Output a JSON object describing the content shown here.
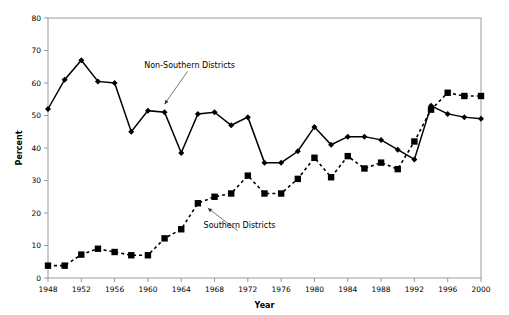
{
  "chart_data": {
    "type": "line",
    "title": "",
    "xlabel": "Year",
    "ylabel": "Percent",
    "xlim": [
      1948,
      2000
    ],
    "ylim": [
      0,
      80
    ],
    "ytick_step": 10,
    "xtick_step": 4,
    "grid": false,
    "legend_position": "inline-annotations",
    "x": [
      1948,
      1950,
      1952,
      1954,
      1956,
      1958,
      1960,
      1962,
      1964,
      1966,
      1968,
      1970,
      1972,
      1974,
      1976,
      1978,
      1980,
      1982,
      1984,
      1986,
      1988,
      1990,
      1992,
      1994,
      1996,
      1998,
      2000
    ],
    "xtick_labels": [
      "1948",
      "1952",
      "1956",
      "1960",
      "1964",
      "1968",
      "1972",
      "1976",
      "1980",
      "1984",
      "1988",
      "1992",
      "1996",
      "2000"
    ],
    "ytick_labels": [
      "0",
      "10",
      "20",
      "30",
      "40",
      "50",
      "60",
      "70",
      "80"
    ],
    "series": [
      {
        "name": "Non-Southern Districts",
        "marker": "diamond",
        "linestyle": "solid",
        "color": "#000000",
        "values": [
          52,
          61,
          67,
          60.5,
          60,
          45,
          51.5,
          51,
          38.5,
          50.5,
          51,
          47,
          49.5,
          35.5,
          35.5,
          39,
          46.5,
          41,
          43.5,
          43.5,
          42.5,
          39.5,
          36.5,
          53,
          50.5,
          49.5,
          49
        ]
      },
      {
        "name": "Southern Districts",
        "marker": "square",
        "linestyle": "dashed",
        "color": "#000000",
        "values": [
          3.8,
          3.8,
          7.2,
          9,
          8,
          7,
          7,
          12.2,
          15,
          23,
          25,
          26,
          31.5,
          26,
          26,
          30.5,
          37,
          31,
          37.5,
          33.7,
          35.5,
          33.5,
          42,
          51.8,
          57,
          56,
          56
        ]
      }
    ],
    "annotations": [
      {
        "text": "Non-Southern Districts",
        "x": 1965,
        "y": 64.5,
        "point_x": 1962,
        "point_y": 53.5
      },
      {
        "text": "Southern Districts",
        "x": 1971,
        "y": 15.5,
        "point_x": 1967.2,
        "point_y": 21.5
      }
    ]
  }
}
